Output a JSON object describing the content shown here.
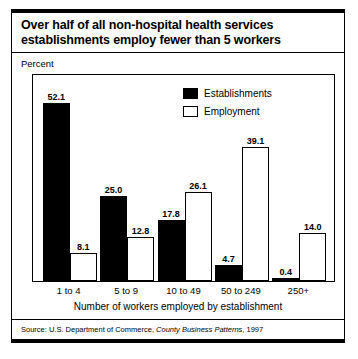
{
  "title": {
    "line1": "Over half of all non-hospital health services",
    "line2": "establishments employ fewer than 5 workers"
  },
  "axis": {
    "ylabel": "Percent",
    "xlabel": "Number of workers employed by establishment"
  },
  "legend": {
    "items": [
      {
        "label": "Establishments",
        "swatch": "solid",
        "color": "#000000"
      },
      {
        "label": "Employment",
        "swatch": "hollow",
        "color": "#ffffff"
      }
    ]
  },
  "source": {
    "prefix": "Source: U.S. Department of Commerce,",
    "italic": "County Business Patterns",
    "suffix": ", 1997"
  },
  "chart_data": {
    "type": "bar",
    "title": "Over half of all non-hospital health services establishments employ fewer than 5 workers",
    "xlabel": "Number of workers employed by establishment",
    "ylabel": "Percent",
    "ylim": [
      0,
      55
    ],
    "grid": false,
    "legend_position": "top-center-right",
    "categories": [
      "1 to 4",
      "5 to 9",
      "10 to 49",
      "50 to 249",
      "250+"
    ],
    "series": [
      {
        "name": "Establishments",
        "values": [
          52.1,
          25.0,
          17.8,
          4.7,
          0.4
        ]
      },
      {
        "name": "Employment",
        "values": [
          8.1,
          12.8,
          26.1,
          39.1,
          14.0
        ]
      }
    ],
    "labels": {
      "Establishments": [
        "52.1",
        "25.0",
        "17.8",
        "4.7",
        "0.4"
      ],
      "Employment": [
        "8.1",
        "12.8",
        "26.1",
        "39.1",
        "14.0"
      ]
    }
  }
}
